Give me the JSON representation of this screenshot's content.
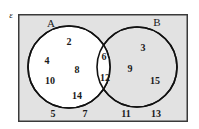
{
  "diagram": {
    "title_label": "Venn diagram",
    "universe": {
      "symbol": "ε",
      "name": "universal-set"
    },
    "sets": [
      {
        "key": "A",
        "label": "A",
        "fill": "#ffffff",
        "stroke": "#111111"
      },
      {
        "key": "B",
        "label": "B",
        "fill": "#e2e2e2",
        "stroke": "#111111"
      }
    ],
    "colors": {
      "background": "#ffffff",
      "universe_fill": "#e2e2e2",
      "universe_stroke": "#3a3a3a",
      "circle_stroke": "#111111",
      "circle_a_fill": "#ffffff",
      "circle_b_fill": "#e2e2e2",
      "intersection_fill": "#ffffff",
      "text": "#1a1a1a"
    },
    "regions": {
      "a_only": {
        "name": "A only",
        "values": [
          2,
          4,
          8,
          10,
          14
        ]
      },
      "intersection": {
        "name": "A intersect B",
        "values": [
          6,
          12
        ]
      },
      "b_only": {
        "name": "B only",
        "values": [
          3,
          9,
          15
        ]
      },
      "outside": {
        "name": "Outside A and B",
        "values": [
          5,
          7,
          11,
          13
        ]
      }
    },
    "elements": [
      {
        "value": "2",
        "region": "a-only",
        "x": 69,
        "y": 42
      },
      {
        "value": "4",
        "region": "a-only",
        "x": 47,
        "y": 61
      },
      {
        "value": "8",
        "region": "a-only",
        "x": 77,
        "y": 70
      },
      {
        "value": "10",
        "region": "a-only",
        "x": 50,
        "y": 81
      },
      {
        "value": "14",
        "region": "a-only",
        "x": 77,
        "y": 96
      },
      {
        "value": "6",
        "region": "intersection",
        "x": 104,
        "y": 57
      },
      {
        "value": "12",
        "region": "intersection",
        "x": 105,
        "y": 78
      },
      {
        "value": "3",
        "region": "b-only",
        "x": 143,
        "y": 48
      },
      {
        "value": "9",
        "region": "b-only",
        "x": 130,
        "y": 69
      },
      {
        "value": "15",
        "region": "b-only",
        "x": 155,
        "y": 81
      },
      {
        "value": "5",
        "region": "outside",
        "x": 53,
        "y": 114
      },
      {
        "value": "7",
        "region": "outside",
        "x": 85,
        "y": 114
      },
      {
        "value": "11",
        "region": "outside",
        "x": 126,
        "y": 114
      },
      {
        "value": "13",
        "region": "outside",
        "x": 156,
        "y": 114
      }
    ],
    "set_labels": [
      {
        "key": "A",
        "text": "A",
        "x": 51,
        "y": 23
      },
      {
        "key": "B",
        "text": "B",
        "x": 157,
        "y": 22
      }
    ],
    "universe_label": {
      "text": "ε",
      "x": 11,
      "y": 15
    },
    "geometry": {
      "rect": {
        "x": 18,
        "y": 14,
        "width": 170,
        "height": 108
      },
      "circle_a": {
        "cx": 69,
        "cy": 67,
        "r": 41
      },
      "circle_b": {
        "cx": 137,
        "cy": 67,
        "r": 40
      }
    }
  }
}
